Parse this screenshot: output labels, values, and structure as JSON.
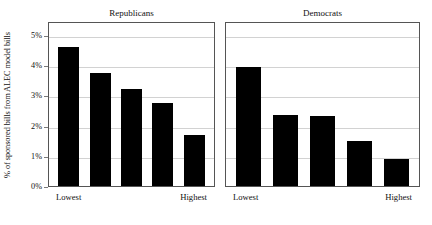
{
  "chart_data": {
    "type": "bar",
    "title": "",
    "xlabel": "",
    "ylabel": "% of sponsored bills from ALEC model bills",
    "ylim": [
      0,
      5
    ],
    "grid": true,
    "legend": "none",
    "ytick_labels": [
      "0%",
      "1%",
      "2%",
      "3%",
      "4%",
      "5%"
    ],
    "ytick_values": [
      0,
      1,
      2,
      3,
      4,
      5
    ],
    "categories": [
      "Lowest",
      "2",
      "3",
      "4",
      "Highest"
    ],
    "xtick_labels": [
      "Lowest",
      "Highest"
    ],
    "panels": [
      {
        "name": "Republicans",
        "values": [
          4.6,
          3.75,
          3.2,
          2.75,
          1.7
        ]
      },
      {
        "name": "Democrats",
        "values": [
          3.95,
          2.35,
          2.33,
          1.5,
          0.9
        ]
      }
    ],
    "bar_color": "#000000",
    "grid_color": "#d2d2d2",
    "frame_color": "#555555"
  }
}
